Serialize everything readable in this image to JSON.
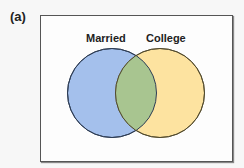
{
  "figure": {
    "panel_label": "(a)",
    "title": ""
  },
  "venn": {
    "sets": [
      {
        "label": "Married",
        "fill": "#a4c0ec",
        "stroke": "#2e3d55"
      },
      {
        "label": "College",
        "fill": "#fde3a0",
        "stroke": "#6b5a30"
      }
    ],
    "intersection": {
      "fill": "#a8c590"
    }
  }
}
